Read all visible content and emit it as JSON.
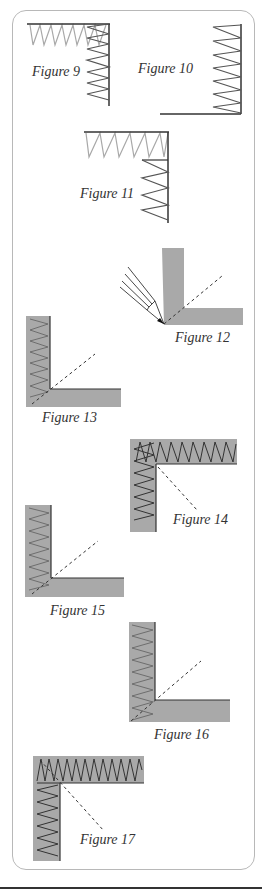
{
  "figures": [
    {
      "id": 9,
      "caption": "Figure 9"
    },
    {
      "id": 10,
      "caption": "Figure 10"
    },
    {
      "id": 11,
      "caption": "Figure 11"
    },
    {
      "id": 12,
      "caption": "Figure 12"
    },
    {
      "id": 13,
      "caption": "Figure 13"
    },
    {
      "id": 14,
      "caption": "Figure 14"
    },
    {
      "id": 15,
      "caption": "Figure 15"
    },
    {
      "id": 16,
      "caption": "Figure 16"
    },
    {
      "id": 17,
      "caption": "Figure 17"
    }
  ],
  "colors": {
    "stitch_dark": "#3a3a3a",
    "stitch_light": "#a8a8a8",
    "fabric_gray": "#a9a9a9",
    "panel_border": "#b8b8b8"
  }
}
